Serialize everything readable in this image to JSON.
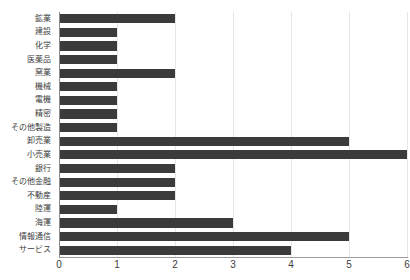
{
  "chart_data": {
    "type": "bar",
    "orientation": "horizontal",
    "title": "",
    "xlabel": "",
    "ylabel": "",
    "xlim": [
      0,
      6
    ],
    "ylim": null,
    "grid": true,
    "legend": false,
    "bar_color": "#3b3b3b",
    "gridline_color": "#e6e6e6",
    "axis_color": "#9a9a9a",
    "xticks": [
      0,
      1,
      2,
      3,
      4,
      5,
      6
    ],
    "xtick_labels": [
      "0",
      "1",
      "2",
      "3",
      "4",
      "5",
      "6"
    ],
    "categories": [
      "鉱業",
      "建設",
      "化学",
      "医薬品",
      "窯業",
      "機械",
      "電機",
      "精密",
      "その他製造",
      "卸売業",
      "小売業",
      "銀行",
      "その他金融",
      "不動産",
      "陸運",
      "海運",
      "情報通信",
      "サービス"
    ],
    "values": [
      2,
      1,
      1,
      1,
      2,
      1,
      1,
      1,
      1,
      5,
      6,
      2,
      2,
      2,
      1,
      3,
      5,
      4
    ]
  }
}
